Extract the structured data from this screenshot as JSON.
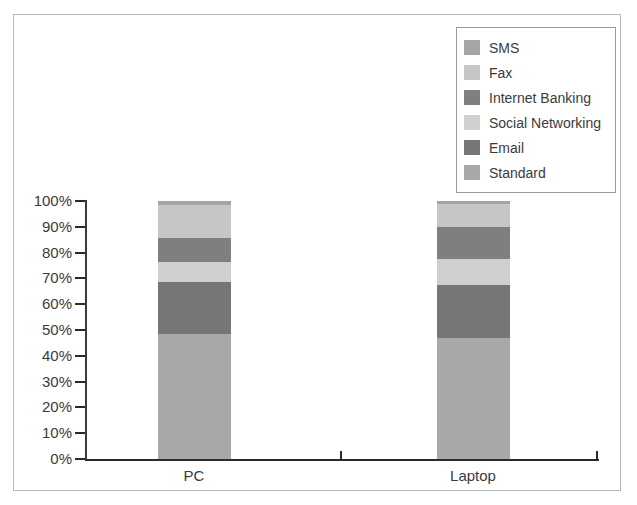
{
  "chart_data": {
    "type": "bar",
    "subtype": "stacked-bar-100-percent",
    "title": "",
    "xlabel": "",
    "ylabel": "",
    "categories": [
      "PC",
      "Laptop"
    ],
    "ylim": [
      0,
      100
    ],
    "ytick_labels": [
      "100%",
      "90%",
      "80%",
      "70%",
      "60%",
      "50%",
      "40%",
      "30%",
      "20%",
      "10%",
      "0%"
    ],
    "ytick_values": [
      100,
      90,
      80,
      70,
      60,
      50,
      40,
      30,
      20,
      10,
      0
    ],
    "grid": false,
    "legend_position": "top-right",
    "stack_order_bottom_to_top": [
      "Standard",
      "Email",
      "Social Networking",
      "Internet Banking",
      "Fax",
      "SMS"
    ],
    "series": [
      {
        "name": "SMS",
        "color": "#a5a5a5",
        "values": [
          1.5,
          1.0
        ]
      },
      {
        "name": "Fax",
        "color": "#c6c6c6",
        "values": [
          13.0,
          9.0
        ]
      },
      {
        "name": "Internet Banking",
        "color": "#7f7f7f",
        "values": [
          9.0,
          12.5
        ]
      },
      {
        "name": "Social Networking",
        "color": "#cfcfcf",
        "values": [
          8.0,
          10.0
        ]
      },
      {
        "name": "Email",
        "color": "#767676",
        "values": [
          20.0,
          20.5
        ]
      },
      {
        "name": "Standard",
        "color": "#a8a8a8",
        "values": [
          48.5,
          47.0
        ]
      }
    ]
  },
  "legend": {
    "items": [
      {
        "label": "SMS"
      },
      {
        "label": "Fax"
      },
      {
        "label": "Internet Banking"
      },
      {
        "label": "Social Networking"
      },
      {
        "label": "Email"
      },
      {
        "label": "Standard"
      }
    ]
  },
  "axes": {
    "x_categories": [
      "PC",
      "Laptop"
    ]
  },
  "colors": {
    "frame": "#b9b9b9",
    "axis": "#2b2b2b",
    "text": "#3b3b3b",
    "background": "#ffffff"
  }
}
